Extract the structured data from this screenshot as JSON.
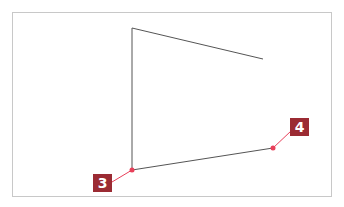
{
  "diagram": {
    "frame": {
      "x": 12,
      "y": 12,
      "width": 320,
      "height": 185,
      "border_color": "#c8c8c8"
    },
    "shape": {
      "stroke_color": "#555555",
      "points": [
        {
          "x": 263,
          "y": 59
        },
        {
          "x": 132,
          "y": 28
        },
        {
          "x": 132,
          "y": 170
        },
        {
          "x": 273,
          "y": 148
        }
      ]
    },
    "markers": [
      {
        "id": "3",
        "label": "3",
        "point": {
          "x": 132,
          "y": 170
        },
        "box": {
          "x": 93,
          "y": 174
        }
      },
      {
        "id": "4",
        "label": "4",
        "point": {
          "x": 273,
          "y": 148
        },
        "box": {
          "x": 290,
          "y": 118
        }
      }
    ],
    "colors": {
      "marker_dot": "#e8405a",
      "leader_line": "#e8405a",
      "label_bg": "#9b2b33",
      "label_text": "#ffffff"
    }
  }
}
